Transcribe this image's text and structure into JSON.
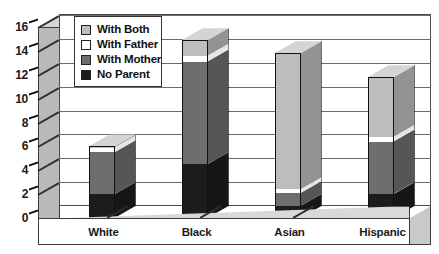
{
  "chart_data": {
    "type": "bar",
    "subtype": "stacked-3d-column",
    "title": "",
    "xlabel": "",
    "ylabel": "",
    "categories": [
      "White",
      "Black",
      "Asian",
      "Hispanic"
    ],
    "ylim": [
      0,
      16
    ],
    "ytick_labels": [
      "0",
      "2",
      "4",
      "6",
      "8",
      "10",
      "12",
      "14",
      "16"
    ],
    "ytick_values": [
      0,
      2,
      4,
      6,
      8,
      10,
      12,
      14,
      16
    ],
    "grid": true,
    "legend_position": "top-left-inside",
    "series": [
      {
        "name": "No Parent",
        "color": "#1c1c1c",
        "values": [
          2.0,
          4.5,
          1.0,
          2.0
        ]
      },
      {
        "name": "With Mother",
        "color": "#6e6e6e",
        "values": [
          3.5,
          8.6,
          1.1,
          4.4
        ]
      },
      {
        "name": "With Father",
        "color": "#ffffff",
        "values": [
          0.4,
          0.5,
          0.3,
          0.4
        ]
      },
      {
        "name": "With Both",
        "color": "#bdbdbd",
        "values": [
          0.1,
          1.3,
          11.4,
          5.0
        ]
      }
    ],
    "totals": [
      6.0,
      14.9,
      12.8,
      11.8
    ],
    "stack_order_bottom_to_top": [
      "No Parent",
      "With Mother",
      "With Father",
      "With Both"
    ]
  },
  "legend": {
    "items": [
      {
        "label": "With Both",
        "swatch": "#bdbdbd"
      },
      {
        "label": "With Father",
        "swatch": "#ffffff"
      },
      {
        "label": "With Mother",
        "swatch": "#6e6e6e"
      },
      {
        "label": "No Parent",
        "swatch": "#1c1c1c"
      }
    ]
  },
  "colors": {
    "plot_background": "#ffffff",
    "wall": "#b9b9b9",
    "floor": "#d9d9d9",
    "gridline": "#6b6b6b",
    "axis": "#111111"
  }
}
